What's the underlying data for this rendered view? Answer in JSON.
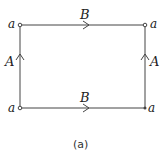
{
  "diagram": {
    "vertex_label": "a",
    "vertices": {
      "top_left": "a",
      "top_right": "a",
      "bottom_left": "a",
      "bottom_right": "a"
    },
    "edges": {
      "top": {
        "label": "B",
        "direction": "right"
      },
      "bottom": {
        "label": "B",
        "direction": "right"
      },
      "left": {
        "label": "A",
        "direction": "up"
      },
      "right": {
        "label": "A",
        "direction": "up"
      }
    },
    "caption": "(a)",
    "colors": {
      "line": "#444444",
      "background": "#ffffff"
    }
  }
}
